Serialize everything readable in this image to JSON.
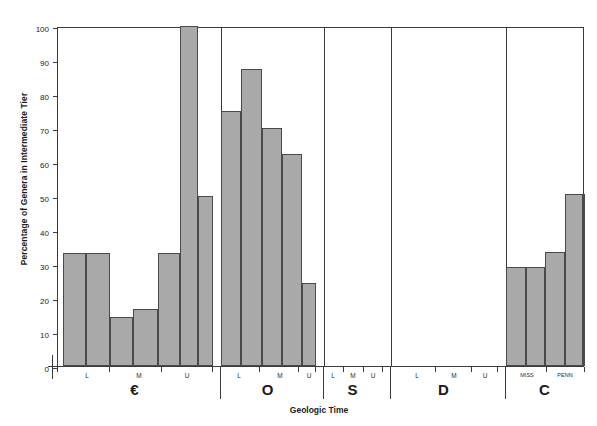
{
  "chart_data": {
    "type": "bar",
    "title": "",
    "xlabel": "Geologic Time",
    "ylabel": "Percentage of Genera in Intermediate Tier",
    "ylim": [
      0,
      100
    ],
    "yticks": [
      0,
      10,
      20,
      30,
      40,
      50,
      60,
      70,
      80,
      90,
      100
    ],
    "grid": false,
    "legend": null,
    "bar_color": "#a9a9a9",
    "bar_edge_color": "#4a4a4a",
    "axis_color": "#3a3a3a",
    "periods": [
      {
        "code": "€",
        "name": "Cambrian",
        "x_start": 0,
        "x_end": 155,
        "subdivisions": [
          {
            "label": "L",
            "center": 30
          },
          {
            "label": "M",
            "center": 82
          },
          {
            "label": "U",
            "center": 130
          }
        ],
        "subdivision_ticks": [
          0,
          52,
          104,
          155
        ],
        "bars": [
          {
            "x0": 5,
            "x1": 28,
            "value": 33.3
          },
          {
            "x0": 28,
            "x1": 52,
            "value": 33.3
          },
          {
            "x0": 52,
            "x1": 75,
            "value": 14.3
          },
          {
            "x0": 75,
            "x1": 100,
            "value": 16.7
          },
          {
            "x0": 100,
            "x1": 122,
            "value": 33.3
          },
          {
            "x0": 122,
            "x1": 140,
            "value": 100.0
          },
          {
            "x0": 140,
            "x1": 155,
            "value": 50.0
          }
        ]
      },
      {
        "code": "O",
        "name": "Ordovician",
        "x_start": 163,
        "x_end": 258,
        "subdivisions": [
          {
            "label": "L",
            "center": 182
          },
          {
            "label": "M",
            "center": 223
          },
          {
            "label": "U",
            "center": 252
          }
        ],
        "subdivision_ticks": [
          163,
          202,
          241,
          258
        ],
        "bars": [
          {
            "x0": 163,
            "x1": 183,
            "value": 75.0
          },
          {
            "x0": 183,
            "x1": 204,
            "value": 87.5
          },
          {
            "x0": 204,
            "x1": 224,
            "value": 70.0
          },
          {
            "x0": 224,
            "x1": 244,
            "value": 62.5
          },
          {
            "x0": 244,
            "x1": 258,
            "value": 24.4
          }
        ]
      },
      {
        "code": "S",
        "name": "Silurian",
        "x_start": 266,
        "x_end": 325,
        "subdivisions": [
          {
            "label": "L",
            "center": 276
          },
          {
            "label": "M",
            "center": 296
          },
          {
            "label": "U",
            "center": 316
          }
        ],
        "subdivision_ticks": [
          266,
          286,
          306,
          325
        ],
        "bars": []
      },
      {
        "code": "D",
        "name": "Devonian",
        "x_start": 333,
        "x_end": 440,
        "subdivisions": [
          {
            "label": "L",
            "center": 360
          },
          {
            "label": "M",
            "center": 397
          },
          {
            "label": "U",
            "center": 428
          }
        ],
        "subdivision_ticks": [
          333,
          378,
          414,
          440
        ],
        "bars": []
      },
      {
        "code": "C",
        "name": "Carboniferous",
        "x_start": 448,
        "x_end": 527,
        "subdivisions": [
          {
            "label": "MISS",
            "center": 470
          },
          {
            "label": "PENN",
            "center": 508
          }
        ],
        "subdivision_ticks": [
          448,
          489,
          527
        ],
        "bars": [
          {
            "x0": 448,
            "x1": 468,
            "value": 29.2
          },
          {
            "x0": 468,
            "x1": 487,
            "value": 29.2
          },
          {
            "x0": 487,
            "x1": 507,
            "value": 33.6
          },
          {
            "x0": 507,
            "x1": 525,
            "value": 50.5
          },
          {
            "x0": 525,
            "x1": 544,
            "value": 50.5
          }
        ]
      }
    ]
  }
}
